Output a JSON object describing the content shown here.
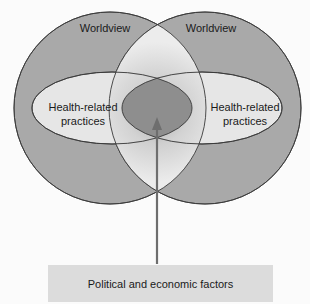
{
  "diagram": {
    "type": "venn",
    "colors": {
      "circle_fill": "#a9a9a9",
      "ellipse_fill": "#e6e6e6",
      "overlap_core": "#909090",
      "arrow": "#707070",
      "box_fill": "#dcdcdc",
      "stroke": "#3a3a3a"
    },
    "circles": [
      {
        "label": "Worldview",
        "inner_label_line1": "Health-related",
        "inner_label_line2": "practices"
      },
      {
        "label": "Worldview",
        "inner_label_line1": "Health-related",
        "inner_label_line2": "practices"
      }
    ],
    "factors_box": {
      "label": "Political and economic factors"
    }
  }
}
